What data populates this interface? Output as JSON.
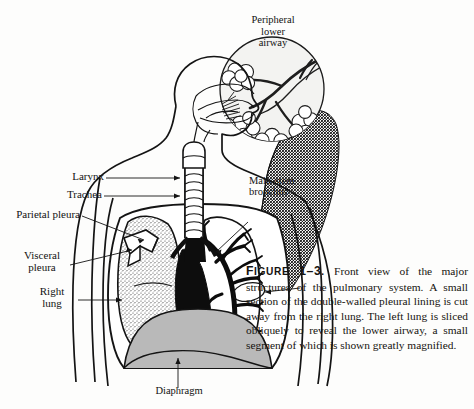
{
  "figure": {
    "number": "1-3",
    "number_label": "FIGURE 1-3.",
    "caption_body": "Front view of the major structures of the pulmonary system. A small section of the double-walled pleural lining is cut away from the right lung. The left lung is sliced obliquely to reveal the lower airway, a small segment of which is shown greatly magnified."
  },
  "inset": {
    "title_line1": "Peripheral",
    "title_line2": "lower",
    "title_line3": "airway"
  },
  "labels": {
    "larynx": "Larynx",
    "trachea": "Trachea",
    "parietal_pleura": "Parietal pleura",
    "visceral_pleura_line1": "Visceral",
    "visceral_pleura_line2": "pleura",
    "right_lung_line1": "Right",
    "right_lung_line2": "lung",
    "main_stem_line1": "Main-stem",
    "main_stem_line2": "bronchus",
    "diaphragm": "Diaphragm"
  },
  "colors": {
    "ink": "#121212",
    "paper": "#fdfdfc",
    "diaphragm_fill": "#b9b9b9",
    "inset_fill": "#f2f2f0",
    "lung_stipple": "#4a4a4a",
    "mediastinum": "#0d0d0d"
  }
}
